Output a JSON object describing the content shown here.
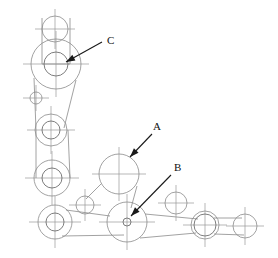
{
  "diagram": {
    "background_color": "#ffffff",
    "line_color": "#8a8a8a",
    "centerline_color": "#9a9a9a",
    "label_color": "#111111",
    "width": 278,
    "height": 258
  },
  "labels": [
    {
      "id": "label-c",
      "text": "C",
      "x": 107,
      "y": 44,
      "leader_from": [
        102,
        42
      ],
      "leader_to": [
        66,
        62
      ],
      "target_name": "upper-large-joint"
    },
    {
      "id": "label-a",
      "text": "A",
      "x": 153,
      "y": 130,
      "leader_from": [
        152,
        134
      ],
      "leader_to": [
        130,
        157
      ],
      "target_name": "center-plain-joint"
    },
    {
      "id": "label-b",
      "text": "B",
      "x": 174,
      "y": 171,
      "leader_from": [
        171,
        175
      ],
      "leader_to": [
        131,
        216
      ],
      "target_name": "lower-pivot-joint"
    }
  ],
  "joints": [
    {
      "name": "top-small-joint",
      "cx": 55,
      "cy": 29,
      "r_outer": 13,
      "r_inner": 0,
      "crosshair": 20
    },
    {
      "name": "upper-large-joint",
      "cx": 56,
      "cy": 64,
      "r_outer": 25,
      "r_inner": 12,
      "crosshair": 33
    },
    {
      "name": "left-tiny-joint",
      "cx": 36,
      "cy": 98,
      "r_outer": 6,
      "r_inner": 0,
      "crosshair": 13
    },
    {
      "name": "mid-rod-upper-joint",
      "cx": 51,
      "cy": 130,
      "r_outer": 16,
      "r_inner": 9,
      "crosshair": 24
    },
    {
      "name": "mid-rod-lower-joint",
      "cx": 52,
      "cy": 178,
      "r_outer": 18,
      "r_inner": 10,
      "crosshair": 27
    },
    {
      "name": "bottom-left-joint",
      "cx": 55,
      "cy": 222,
      "r_outer": 17,
      "r_inner": 9,
      "crosshair": 26
    },
    {
      "name": "bottom-left-small-joint",
      "cx": 85,
      "cy": 205,
      "r_outer": 9,
      "r_inner": 0,
      "crosshair": 16
    },
    {
      "name": "center-plain-joint",
      "cx": 119,
      "cy": 174,
      "r_outer": 20,
      "r_inner": 0,
      "crosshair": 27
    },
    {
      "name": "lower-pivot-joint",
      "cx": 127,
      "cy": 222,
      "r_outer": 20,
      "r_inner": 4,
      "crosshair": 28
    },
    {
      "name": "right-small-joint",
      "cx": 176,
      "cy": 203,
      "r_outer": 11,
      "r_inner": 0,
      "crosshair": 18
    },
    {
      "name": "right-double-joint",
      "cx": 205,
      "cy": 225,
      "r_outer": 14,
      "r_inner": 11,
      "crosshair": 22
    },
    {
      "name": "far-right-joint",
      "cx": 245,
      "cy": 226,
      "r_outer": 12,
      "r_inner": 0,
      "crosshair": 19
    }
  ],
  "links": [
    {
      "name": "link-top-to-upper",
      "points": "42,18 42,64 70,64 70,18"
    },
    {
      "name": "link-upper-to-midrod",
      "points": "34,78 36,130"
    },
    {
      "name": "link-upper-to-midrod2",
      "points": "76,80 64,128"
    },
    {
      "name": "link-midrod-body",
      "points": "36,130 36,178"
    },
    {
      "name": "link-midrod-body2",
      "points": "68,130 70,178"
    },
    {
      "name": "link-center-to-small",
      "points": "101,184 86,199"
    },
    {
      "name": "link-center-to-pivot",
      "points": "137,186 131,208"
    },
    {
      "name": "link-bottomleft-pivot",
      "points": "62,236 124,235"
    },
    {
      "name": "link-bottomleft-pivot2",
      "points": "66,210 110,216"
    },
    {
      "name": "link-pivot-to-right",
      "points": "145,214 198,219"
    },
    {
      "name": "link-pivot-to-right2",
      "points": "140,238 196,233"
    },
    {
      "name": "link-right-to-farright",
      "points": "214,218 242,218"
    },
    {
      "name": "link-right-to-farright2",
      "points": "214,234 244,235"
    }
  ]
}
